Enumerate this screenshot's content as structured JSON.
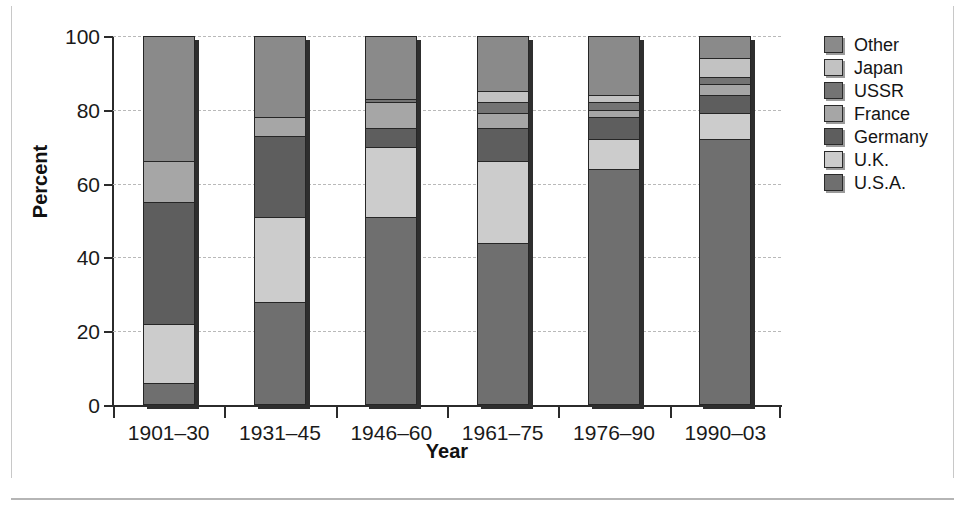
{
  "chart_data": {
    "type": "bar",
    "subtype": "stacked-bar-100-percent",
    "title": "",
    "xlabel": "Year",
    "ylabel": "Percent",
    "ylim": [
      0,
      100
    ],
    "yticks": [
      0,
      20,
      40,
      60,
      80,
      100
    ],
    "ytick_labels": [
      "0",
      "20",
      "40",
      "60",
      "80",
      "100"
    ],
    "grid": true,
    "grid_style": "dashed-horizontal",
    "legend_position": "right",
    "legend_order_top_to_bottom": [
      "Other",
      "Japan",
      "USSR",
      "France",
      "Germany",
      "U.K.",
      "U.S.A."
    ],
    "stack_order_bottom_to_top": [
      "U.S.A.",
      "U.K.",
      "Germany",
      "France",
      "USSR",
      "Japan",
      "Other"
    ],
    "categories": [
      "1901–30",
      "1931–45",
      "1946–60",
      "1961–75",
      "1976–90",
      "1990–03"
    ],
    "series": [
      {
        "name": "U.S.A.",
        "color": "#6f6f6f",
        "values": [
          6,
          28,
          51,
          44,
          64,
          72
        ]
      },
      {
        "name": "U.K.",
        "color": "#cccccc",
        "values": [
          16,
          23,
          19,
          22,
          8,
          7
        ]
      },
      {
        "name": "Germany",
        "color": "#5e5e5e",
        "values": [
          33,
          22,
          5,
          9,
          6,
          5
        ]
      },
      {
        "name": "France",
        "color": "#a6a6a6",
        "values": [
          11,
          5,
          7,
          4,
          2,
          3
        ]
      },
      {
        "name": "USSR",
        "color": "#747474",
        "values": [
          0,
          0,
          1,
          3,
          2,
          2
        ]
      },
      {
        "name": "Japan",
        "color": "#c2c2c2",
        "values": [
          0,
          0,
          0,
          3,
          2,
          5
        ]
      },
      {
        "name": "Other",
        "color": "#8a8a8a",
        "values": [
          34,
          22,
          17,
          15,
          16,
          6
        ]
      }
    ]
  },
  "axes": {
    "y_title": "Percent",
    "x_title": "Year"
  },
  "legend": {
    "items": [
      {
        "label": "Other",
        "color": "#8a8a8a"
      },
      {
        "label": "Japan",
        "color": "#c2c2c2"
      },
      {
        "label": "USSR",
        "color": "#747474"
      },
      {
        "label": "France",
        "color": "#a6a6a6"
      },
      {
        "label": "Germany",
        "color": "#5e5e5e"
      },
      {
        "label": "U.K.",
        "color": "#cccccc"
      },
      {
        "label": "U.S.A.",
        "color": "#6f6f6f"
      }
    ]
  }
}
